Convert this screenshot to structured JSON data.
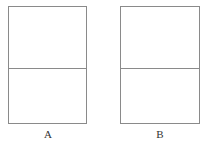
{
  "diagram": {
    "panels": [
      {
        "id": "A",
        "label": "A"
      },
      {
        "id": "B",
        "label": "B"
      }
    ],
    "colors": {
      "stroke": "#8a8a8a",
      "background": "#ffffff",
      "label": "#333333"
    }
  }
}
